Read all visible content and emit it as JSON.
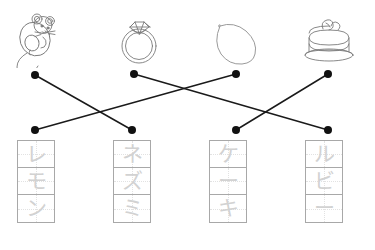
{
  "worksheet": {
    "title": "Katakana Picture-Word Matching Worksheet",
    "instruction": "",
    "line_color": "#1a1a1a",
    "dot_color": "#111111",
    "grid_border_color": "#a8a8a8",
    "trace_glyph_color": "#d2d2d2",
    "picture_stroke_color": "#7a7a7a"
  },
  "pictures": [
    {
      "id": "mouse",
      "name": "mouse-picture",
      "icon": "mouse-icon",
      "word": "ネズミ",
      "x": 12,
      "y": 10,
      "dot_x": 35,
      "dot_y": 75
    },
    {
      "id": "ring",
      "name": "ring-picture",
      "icon": "ring-icon",
      "word": "ルビー",
      "x": 108,
      "y": 10,
      "dot_x": 134,
      "dot_y": 74
    },
    {
      "id": "lemon",
      "name": "lemon-picture",
      "icon": "lemon-icon",
      "word": "レモン",
      "x": 206,
      "y": 11,
      "dot_x": 236,
      "dot_y": 74
    },
    {
      "id": "cake",
      "name": "cake-picture",
      "icon": "cake-icon",
      "word": "ケーキ",
      "x": 298,
      "y": 10,
      "dot_x": 328,
      "dot_y": 74
    }
  ],
  "word_grids": [
    {
      "id": "remon",
      "name": "word-grid-remon",
      "word": "レモン",
      "romaji": "remon",
      "characters": [
        "レ",
        "モ",
        "ン"
      ],
      "x": 17,
      "y": 140,
      "dot_x": 35,
      "dot_y": 130
    },
    {
      "id": "nezumi",
      "name": "word-grid-nezumi",
      "word": "ネズミ",
      "romaji": "nezumi",
      "characters": [
        "ネ",
        "ズ",
        "ミ"
      ],
      "x": 113,
      "y": 140,
      "dot_x": 132,
      "dot_y": 130
    },
    {
      "id": "keeki",
      "name": "word-grid-keeki",
      "word": "ケーキ",
      "romaji": "keeki",
      "characters": [
        "ケ",
        "ー",
        "キ"
      ],
      "x": 209,
      "y": 140,
      "dot_x": 236,
      "dot_y": 130
    },
    {
      "id": "rubii",
      "name": "word-grid-rubii",
      "word": "ルビー",
      "romaji": "rubii",
      "characters": [
        "ル",
        "ビ",
        "ー"
      ],
      "x": 305,
      "y": 140,
      "dot_x": 328,
      "dot_y": 130
    }
  ],
  "connections": [
    {
      "from": "mouse",
      "to": "nezumi",
      "x1": 35,
      "y1": 75,
      "x2": 132,
      "y2": 130
    },
    {
      "from": "ring",
      "to": "rubii",
      "x1": 134,
      "y1": 74,
      "x2": 328,
      "y2": 130
    },
    {
      "from": "lemon",
      "to": "remon",
      "x1": 236,
      "y1": 74,
      "x2": 35,
      "y2": 130
    },
    {
      "from": "cake",
      "to": "keeki",
      "x1": 328,
      "y1": 74,
      "x2": 236,
      "y2": 130
    }
  ]
}
